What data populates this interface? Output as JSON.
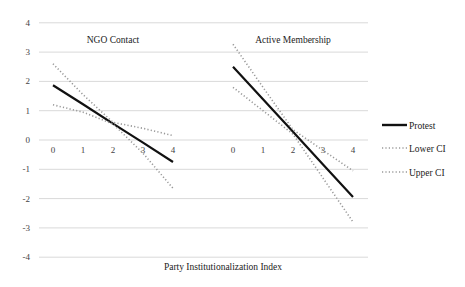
{
  "chart_data": {
    "type": "line",
    "xlabel": "Party Institutionalization Index",
    "ylabel": "",
    "ylim": [
      -4,
      4
    ],
    "yticks": [
      4,
      3,
      2,
      1,
      0,
      -1,
      -2,
      -3,
      -4
    ],
    "grid": true,
    "legend_position": "right",
    "legend": [
      "Protest",
      "Lower CI",
      "Upper CI"
    ],
    "panels": [
      {
        "title": "NGO Contact",
        "x": [
          0,
          1,
          2,
          3,
          4
        ],
        "series": [
          {
            "name": "Protest",
            "style": "solid",
            "values": [
              1.87,
              1.22,
              0.56,
              -0.09,
              -0.75
            ]
          },
          {
            "name": "Lower CI",
            "style": "dotted",
            "values": [
              1.2,
              0.95,
              0.55,
              -0.45,
              -1.65
            ]
          },
          {
            "name": "Upper CI",
            "style": "dotted",
            "values": [
              2.6,
              1.55,
              0.6,
              0.4,
              0.15
            ]
          }
        ]
      },
      {
        "title": "Active Membership",
        "x": [
          0,
          1,
          2,
          3,
          4
        ],
        "series": [
          {
            "name": "Protest",
            "style": "solid",
            "values": [
              2.5,
              1.39,
              0.28,
              -0.84,
              -1.95
            ]
          },
          {
            "name": "Lower CI",
            "style": "dotted",
            "values": [
              1.8,
              1.0,
              0.2,
              -1.3,
              -2.8
            ]
          },
          {
            "name": "Upper CI",
            "style": "dotted",
            "values": [
              3.27,
              1.8,
              0.35,
              -0.35,
              -1.05
            ]
          }
        ]
      }
    ]
  },
  "labels": {
    "panel_left": "NGO Contact",
    "panel_right": "Active Membership",
    "xlabel": "Party Institutionalization Index",
    "legend_protest": "Protest",
    "legend_lower": "Lower CI",
    "legend_upper": "Upper CI"
  }
}
